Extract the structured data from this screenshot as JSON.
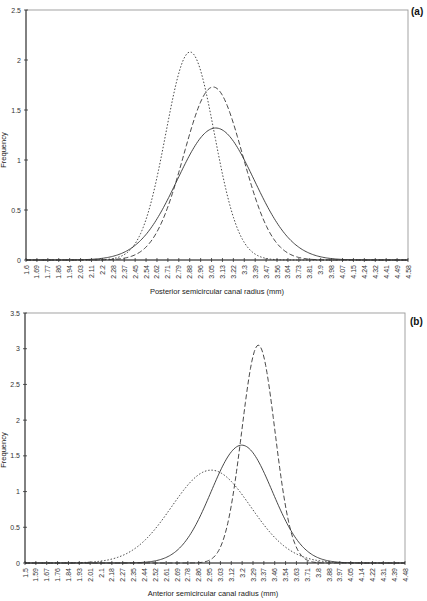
{
  "chart_data": [
    {
      "panel": "(a)",
      "type": "line",
      "title": "",
      "xlabel": "Posterior semicircular canal radius (mm)",
      "ylabel": "Frequency",
      "ylim": [
        0,
        2.5
      ],
      "yticks": [
        "0",
        "0.5",
        "1",
        "1.5",
        "2",
        "2.5"
      ],
      "grid": false,
      "legend": "none",
      "categories": [
        "1.6",
        "1.69",
        "1.77",
        "1.86",
        "1.94",
        "2.03",
        "2.11",
        "2.2",
        "2.28",
        "2.37",
        "2.45",
        "2.54",
        "2.62",
        "2.71",
        "2.79",
        "2.88",
        "2.96",
        "3.05",
        "3.13",
        "3.22",
        "3.3",
        "3.39",
        "3.47",
        "3.56",
        "3.64",
        "3.73",
        "3.81",
        "3.9",
        "3.98",
        "4.07",
        "4.15",
        "4.24",
        "4.32",
        "4.41",
        "4.49",
        "4.58"
      ],
      "series": [
        {
          "name": "dotted",
          "style": "dotted",
          "mean": 2.88,
          "peak": 2.08,
          "sd": 0.19
        },
        {
          "name": "dashed",
          "style": "dashed",
          "mean": 3.06,
          "peak": 1.73,
          "sd": 0.23
        },
        {
          "name": "solid",
          "style": "solid",
          "mean": 3.08,
          "peak": 1.32,
          "sd": 0.3
        }
      ]
    },
    {
      "panel": "(b)",
      "type": "line",
      "title": "",
      "xlabel": "Anterior semicircular canal radius (mm)",
      "ylabel": "Frequency",
      "ylim": [
        0,
        3.5
      ],
      "yticks": [
        "0",
        "0.5",
        "1",
        "1.5",
        "2",
        "2.5",
        "3",
        "3.5"
      ],
      "grid": false,
      "legend": "none",
      "categories": [
        "1.5",
        "1.59",
        "1.67",
        "1.76",
        "1.84",
        "1.93",
        "2.01",
        "2.1",
        "2.18",
        "2.27",
        "2.35",
        "2.44",
        "2.52",
        "2.61",
        "2.69",
        "2.78",
        "2.86",
        "2.95",
        "3.03",
        "3.12",
        "3.2",
        "3.29",
        "3.37",
        "3.46",
        "3.54",
        "3.63",
        "3.71",
        "3.8",
        "3.88",
        "3.97",
        "4.05",
        "4.14",
        "4.22",
        "4.31",
        "4.39",
        "4.48"
      ],
      "series": [
        {
          "name": "dotted",
          "style": "dotted",
          "mean": 2.96,
          "peak": 1.3,
          "sd": 0.31
        },
        {
          "name": "solid",
          "style": "solid",
          "mean": 3.2,
          "peak": 1.65,
          "sd": 0.24
        },
        {
          "name": "dashed",
          "style": "dashed",
          "mean": 3.33,
          "peak": 3.05,
          "sd": 0.13
        }
      ]
    }
  ],
  "panels": {
    "a": {
      "label": "(a)",
      "ylabel": "Frequency",
      "xlabel": "Posterior semicircular canal radius (mm)"
    },
    "b": {
      "label": "(b)",
      "ylabel": "Frequency",
      "xlabel": "Anterior semicircular canal radius (mm)"
    }
  },
  "colors": {
    "line": "#333333",
    "axis": "#444444",
    "frame": "#888888"
  }
}
